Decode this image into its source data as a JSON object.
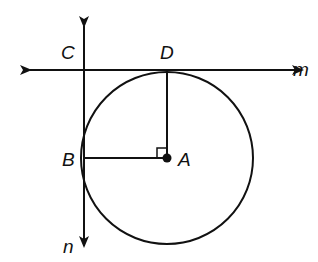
{
  "diagram": {
    "type": "geometry",
    "circle": {
      "center_label": "A",
      "cx": 167,
      "cy": 158,
      "r": 86
    },
    "points": [
      {
        "label": "A",
        "x": 167,
        "y": 158,
        "label_x": 178,
        "label_y": 166
      },
      {
        "label": "B",
        "x": 84,
        "y": 158,
        "label_x": 62,
        "label_y": 166
      },
      {
        "label": "C",
        "x": 84,
        "y": 70,
        "label_x": 61,
        "label_y": 59
      },
      {
        "label": "D",
        "x": 167,
        "y": 70,
        "label_x": 160,
        "label_y": 59
      }
    ],
    "lines": [
      {
        "label": "m",
        "label_x": 293,
        "label_y": 76,
        "x1": 26,
        "y1": 70,
        "x2": 306,
        "y2": 70,
        "arrows": "both"
      },
      {
        "label": "n",
        "label_x": 63,
        "label_y": 253,
        "x1": 84,
        "y1": 22,
        "x2": 84,
        "y2": 250,
        "arrows": "both"
      }
    ],
    "segments": [
      {
        "from": "D",
        "to": "A"
      },
      {
        "from": "B",
        "to": "A"
      }
    ],
    "right_angle_marker": {
      "at": "A",
      "size": 10
    },
    "colors": {
      "stroke": "#111111",
      "background": "#ffffff"
    }
  }
}
